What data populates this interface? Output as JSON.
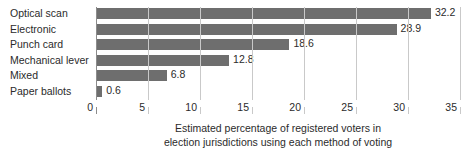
{
  "chart_data": {
    "type": "bar",
    "orientation": "horizontal",
    "title": "",
    "subtitle": "",
    "categories": [
      "Optical scan",
      "Electronic",
      "Punch card",
      "Mechanical lever",
      "Mixed",
      "Paper ballots"
    ],
    "values": [
      32.2,
      28.9,
      18.6,
      12.8,
      6.8,
      0.6
    ],
    "value_labels": [
      "32.2",
      "28.9",
      "18.6",
      "12.8",
      "6.8",
      "0.6"
    ],
    "xlabel": "Estimated percentage of registered voters in election jurisdictions using each method of voting",
    "ylabel": "",
    "xlim": [
      0,
      35
    ],
    "xticks": [
      0,
      5,
      10,
      15,
      20,
      25,
      30,
      35
    ],
    "xtick_labels": [
      "0",
      "5",
      "10",
      "15",
      "20",
      "25",
      "30",
      "35"
    ],
    "grid": true,
    "grid_axis": "x",
    "legend": false,
    "legend_position": "none",
    "bar_color": "#6e6e6e",
    "gridline_color": "#c9c9c9",
    "axis_color": "#8c8c8c",
    "background_color": "#ffffff",
    "text_color": "#2b2b2b",
    "data_labels_shown": true
  },
  "caption": {
    "line1": "Estimated percentage of registered voters in",
    "line2": "election jurisdictions using each method of voting"
  }
}
